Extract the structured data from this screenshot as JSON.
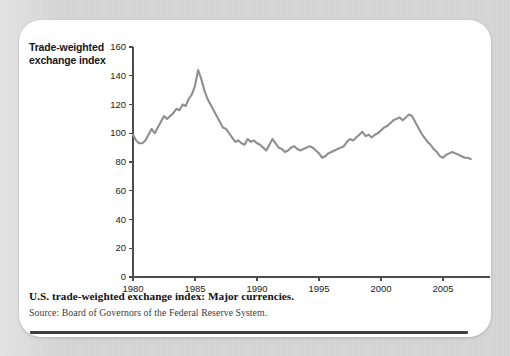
{
  "figure": {
    "axis_title_line1": "Trade-weighted",
    "axis_title_line2": "exchange index",
    "caption": "U.S. trade-weighted exchange index: Major currencies.",
    "source": "Source: Board of Governors of the Federal Reserve System.",
    "line_color": "#8d8f91",
    "axis_color": "#4a4c50",
    "background_color": "#ffffff",
    "page_background_color": "#d6d6d6",
    "rule_color": "#3c3e42"
  },
  "chart_data": {
    "type": "line",
    "title": "U.S. trade-weighted exchange index: Major currencies.",
    "xlabel": "",
    "ylabel": "Trade-weighted exchange index",
    "xlim": [
      1980,
      2007.5
    ],
    "ylim": [
      0,
      160
    ],
    "ytick_values": [
      0,
      20,
      40,
      60,
      80,
      100,
      120,
      140,
      160
    ],
    "ytick_labels": [
      "0",
      "20",
      "40",
      "60",
      "80",
      "100",
      "120",
      "140",
      "160"
    ],
    "xtick_values": [
      1980,
      1985,
      1990,
      1995,
      2000,
      2005
    ],
    "xtick_labels": [
      "1980",
      "1985",
      "1990",
      "1995",
      "2000",
      "2005"
    ],
    "grid": false,
    "legend": false,
    "series": [
      {
        "name": "Major currencies index",
        "color": "#8d8f91",
        "x": [
          1980.0,
          1980.25,
          1980.5,
          1980.75,
          1981.0,
          1981.25,
          1981.5,
          1981.75,
          1982.0,
          1982.25,
          1982.5,
          1982.75,
          1983.0,
          1983.25,
          1983.5,
          1983.75,
          1984.0,
          1984.25,
          1984.5,
          1984.75,
          1985.0,
          1985.25,
          1985.5,
          1985.75,
          1986.0,
          1986.25,
          1986.5,
          1986.75,
          1987.0,
          1987.25,
          1987.5,
          1987.75,
          1988.0,
          1988.25,
          1988.5,
          1988.75,
          1989.0,
          1989.25,
          1989.5,
          1989.75,
          1990.0,
          1990.25,
          1990.5,
          1990.75,
          1991.0,
          1991.25,
          1991.5,
          1991.75,
          1992.0,
          1992.25,
          1992.5,
          1992.75,
          1993.0,
          1993.25,
          1993.5,
          1993.75,
          1994.0,
          1994.25,
          1994.5,
          1994.75,
          1995.0,
          1995.25,
          1995.5,
          1995.75,
          1996.0,
          1996.25,
          1996.5,
          1996.75,
          1997.0,
          1997.25,
          1997.5,
          1997.75,
          1998.0,
          1998.25,
          1998.5,
          1998.75,
          1999.0,
          1999.25,
          1999.5,
          1999.75,
          2000.0,
          2000.25,
          2000.5,
          2000.75,
          2001.0,
          2001.25,
          2001.5,
          2001.75,
          2002.0,
          2002.25,
          2002.5,
          2002.75,
          2003.0,
          2003.25,
          2003.5,
          2003.75,
          2004.0,
          2004.25,
          2004.5,
          2004.75,
          2005.0,
          2005.25,
          2005.5,
          2005.75,
          2006.0,
          2006.25,
          2006.5,
          2006.75,
          2007.0,
          2007.25
        ],
        "y": [
          99,
          95,
          93,
          93,
          95,
          99,
          103,
          100,
          104,
          108,
          112,
          110,
          112,
          114,
          117,
          116,
          120,
          119,
          124,
          127,
          133,
          144,
          138,
          130,
          124,
          120,
          116,
          112,
          108,
          104,
          103,
          100,
          97,
          94,
          95,
          93,
          92,
          96,
          94,
          95,
          93,
          92,
          90,
          88,
          92,
          96,
          93,
          90,
          89,
          87,
          88,
          90,
          91,
          89,
          88,
          89,
          90,
          91,
          90,
          88,
          86,
          83,
          84,
          86,
          87,
          88,
          89,
          90,
          91,
          94,
          96,
          95,
          97,
          99,
          101,
          98,
          99,
          97,
          99,
          100,
          102,
          104,
          105,
          107,
          109,
          110,
          111,
          109,
          111,
          113,
          112,
          108,
          104,
          100,
          97,
          94,
          92,
          89,
          87,
          84,
          83,
          85,
          86,
          87,
          86,
          85,
          84,
          83,
          83,
          82
        ]
      }
    ]
  }
}
